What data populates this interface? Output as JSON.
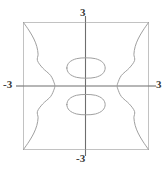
{
  "figure": {
    "kind": "implicit-curve-plot",
    "background_color": "#ffffff",
    "frame_color": "#b9b9b9",
    "axis_color": "#6e6e6e",
    "curve_color": "#9a9a9a",
    "label_color": "#3a3a3a"
  },
  "chart_data": {
    "type": "line",
    "title": "",
    "xlabel": "",
    "ylabel": "",
    "xlim": [
      -3,
      3
    ],
    "ylim": [
      -3,
      3
    ],
    "grid": false,
    "legend": null,
    "axis_ticks": {
      "x": [
        -3,
        3
      ],
      "y": [
        -3,
        3
      ]
    },
    "tick_labels": {
      "x_min": "-3",
      "x_max": "3",
      "y_min": "-3",
      "y_max": "3"
    },
    "series": [
      {
        "name": "upper-oval",
        "closed": true,
        "center": [
          0,
          0.85
        ],
        "semi_axes": [
          0.92,
          0.48
        ],
        "points": [
          [
            -0.92,
            0.85
          ],
          [
            -0.8,
            1.12
          ],
          [
            -0.46,
            1.29
          ],
          [
            0.0,
            1.33
          ],
          [
            0.46,
            1.29
          ],
          [
            0.8,
            1.12
          ],
          [
            0.92,
            0.85
          ],
          [
            0.8,
            0.58
          ],
          [
            0.46,
            0.41
          ],
          [
            0.0,
            0.37
          ],
          [
            -0.46,
            0.41
          ],
          [
            -0.8,
            0.58
          ],
          [
            -0.92,
            0.85
          ]
        ]
      },
      {
        "name": "lower-oval",
        "closed": true,
        "center": [
          0,
          -0.88
        ],
        "semi_axes": [
          0.92,
          0.48
        ],
        "points": [
          [
            -0.92,
            -0.88
          ],
          [
            -0.8,
            -0.61
          ],
          [
            -0.46,
            -0.44
          ],
          [
            0.0,
            -0.4
          ],
          [
            0.46,
            -0.44
          ],
          [
            0.8,
            -0.61
          ],
          [
            0.92,
            -0.88
          ],
          [
            0.8,
            -1.15
          ],
          [
            0.46,
            -1.32
          ],
          [
            0.0,
            -1.36
          ],
          [
            -0.46,
            -1.32
          ],
          [
            -0.8,
            -1.15
          ],
          [
            -0.92,
            -0.88
          ]
        ]
      },
      {
        "name": "left-branch",
        "closed": false,
        "points": [
          [
            -3.0,
            3.0
          ],
          [
            -2.72,
            2.6
          ],
          [
            -2.5,
            2.22
          ],
          [
            -2.36,
            1.86
          ],
          [
            -2.3,
            1.5
          ],
          [
            -2.33,
            1.2
          ],
          [
            -2.08,
            0.85
          ],
          [
            -1.7,
            0.5
          ],
          [
            -1.53,
            0.15
          ],
          [
            -1.5,
            0.0
          ],
          [
            -1.53,
            -0.15
          ],
          [
            -1.7,
            -0.5
          ],
          [
            -2.08,
            -0.85
          ],
          [
            -2.33,
            -1.2
          ],
          [
            -2.3,
            -1.5
          ],
          [
            -2.36,
            -1.86
          ],
          [
            -2.5,
            -2.22
          ],
          [
            -2.72,
            -2.6
          ],
          [
            -3.0,
            -3.0
          ]
        ]
      },
      {
        "name": "right-branch",
        "closed": false,
        "points": [
          [
            3.0,
            3.0
          ],
          [
            2.72,
            2.6
          ],
          [
            2.5,
            2.22
          ],
          [
            2.36,
            1.86
          ],
          [
            2.3,
            1.5
          ],
          [
            2.33,
            1.2
          ],
          [
            2.08,
            0.85
          ],
          [
            1.7,
            0.5
          ],
          [
            1.53,
            0.15
          ],
          [
            1.5,
            0.0
          ],
          [
            1.53,
            -0.15
          ],
          [
            1.7,
            -0.5
          ],
          [
            2.08,
            -0.85
          ],
          [
            2.33,
            -1.2
          ],
          [
            2.3,
            -1.5
          ],
          [
            2.36,
            -1.86
          ],
          [
            2.5,
            -2.22
          ],
          [
            2.72,
            -2.6
          ],
          [
            3.0,
            -3.0
          ]
        ]
      }
    ],
    "annotations": []
  }
}
